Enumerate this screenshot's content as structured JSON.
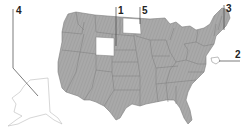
{
  "map": {
    "title": "United States map with numbered labels",
    "colors": {
      "state_fill": "#a8a8a8",
      "state_border": "#7a7a7a",
      "highlight_fill": "#ffffff",
      "leader_line": "#444444"
    },
    "labels": [
      {
        "id": "1",
        "text": "1",
        "target": "Wyoming"
      },
      {
        "id": "2",
        "text": "2",
        "target": "Maryland"
      },
      {
        "id": "3",
        "text": "3",
        "target": "New Hampshire"
      },
      {
        "id": "4",
        "text": "4",
        "target": "Alaska"
      },
      {
        "id": "5",
        "text": "5",
        "target": "North Dakota"
      }
    ]
  }
}
